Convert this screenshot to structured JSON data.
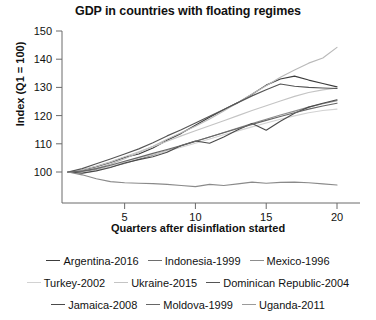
{
  "chart_data": {
    "type": "line",
    "title": "GDP in countries with floating regimes",
    "xlabel": "Quarters after disinflation started",
    "ylabel": "Index (Q1 = 100)",
    "xlim": [
      1,
      20
    ],
    "ylim": [
      93,
      150
    ],
    "xticks": [
      5,
      10,
      15,
      20
    ],
    "yticks": [
      100,
      110,
      120,
      130,
      140,
      150
    ],
    "grid": false,
    "legend_position": "bottom",
    "x": [
      1,
      2,
      3,
      4,
      5,
      6,
      7,
      8,
      9,
      10,
      11,
      12,
      13,
      14,
      15,
      16,
      17,
      18,
      19,
      20
    ],
    "series": [
      {
        "name": "Argentina-2016",
        "color": "#3c3c3c",
        "values": [
          100,
          100.6,
          101.9,
          103.4,
          105.2,
          106.4,
          108.5,
          111.3,
          113.7,
          116.6,
          119.4,
          122.1,
          124.6,
          127.6,
          130.8,
          133.0,
          134.0,
          132.6,
          131.4,
          130.2
        ]
      },
      {
        "name": "Indonesia-1999",
        "color": "#b9b9b9",
        "values": [
          100,
          100.4,
          101.3,
          102.8,
          104.7,
          106.9,
          109.1,
          111.6,
          113.9,
          116.2,
          118.8,
          121.6,
          124.6,
          127.7,
          130.6,
          133.6,
          136.2,
          138.6,
          140.4,
          144.2
        ]
      },
      {
        "name": "Mexico-1996",
        "color": "#8d8d8d",
        "values": [
          100,
          100.2,
          100.9,
          101.8,
          103.0,
          104.5,
          106.0,
          107.6,
          109.2,
          110.8,
          112.4,
          114.0,
          115.6,
          117.2,
          118.7,
          120.2,
          121.6,
          123.0,
          124.2,
          125.3
        ]
      },
      {
        "name": "Turkey-2002",
        "color": "#d2d2d2",
        "values": [
          100,
          99.4,
          100.6,
          102.0,
          103.6,
          105.0,
          106.2,
          107.4,
          108.8,
          110.2,
          111.7,
          113.2,
          114.6,
          116.0,
          117.4,
          118.7,
          119.9,
          121.0,
          121.8,
          122.3
        ]
      },
      {
        "name": "Ukraine-2015",
        "color": "#c4c4c4",
        "values": [
          100,
          100.8,
          102.1,
          103.6,
          105.4,
          107.2,
          109.0,
          110.9,
          112.8,
          114.6,
          116.4,
          118.2,
          120.0,
          121.8,
          123.5,
          125.2,
          126.8,
          128.2,
          129.1,
          129.8
        ]
      },
      {
        "name": "Dominican Republic-2004",
        "color": "#555555",
        "values": [
          100,
          101.2,
          102.9,
          104.6,
          106.4,
          108.2,
          110.4,
          112.8,
          115.0,
          117.4,
          119.8,
          122.2,
          124.6,
          127.0,
          129.2,
          131.2,
          130.4,
          130.0,
          129.8,
          129.6
        ]
      },
      {
        "name": "Jamaica-2008",
        "color": "#4a4a4a",
        "values": [
          100,
          99.6,
          100.4,
          101.6,
          103.2,
          104.4,
          105.4,
          107.0,
          109.4,
          111.0,
          110.2,
          112.4,
          115.0,
          117.2,
          114.8,
          118.0,
          120.8,
          123.0,
          124.4,
          125.6
        ]
      },
      {
        "name": "Moldova-1999",
        "color": "#666666",
        "values": [
          100,
          100.3,
          101.2,
          102.4,
          103.8,
          105.2,
          106.6,
          108.0,
          109.4,
          110.9,
          112.4,
          113.9,
          115.4,
          116.9,
          118.3,
          119.7,
          121.0,
          122.3,
          123.4,
          124.4
        ]
      },
      {
        "name": "Uganda-2011",
        "color": "#8a8a8a",
        "values": [
          100,
          99.0,
          97.6,
          96.6,
          96.2,
          96.0,
          95.9,
          95.6,
          95.2,
          94.8,
          95.6,
          95.2,
          95.8,
          96.4,
          96.0,
          96.3,
          96.4,
          96.2,
          95.8,
          95.4
        ]
      }
    ]
  },
  "legend": {
    "rows": [
      [
        {
          "label": "Argentina-2016",
          "color": "#3c3c3c"
        },
        {
          "label": "Indonesia-1999",
          "color": "#6e6e6e"
        },
        {
          "label": "Mexico-1996",
          "color": "#8d8d8d"
        }
      ],
      [
        {
          "label": "Turkey-2002",
          "color": "#d2d2d2"
        },
        {
          "label": "Ukraine-2015",
          "color": "#c4c4c4"
        },
        {
          "label": "Dominican Republic-2004",
          "color": "#555555"
        }
      ],
      [
        {
          "label": "Jamaica-2008",
          "color": "#4a4a4a"
        },
        {
          "label": "Moldova-1999",
          "color": "#666666"
        },
        {
          "label": "Uganda-2011",
          "color": "#9a9a9a"
        }
      ]
    ]
  }
}
